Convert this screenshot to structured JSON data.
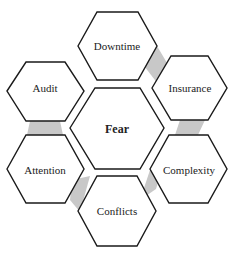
{
  "diagram": {
    "center": {
      "label": "Fear"
    },
    "nodes": [
      {
        "id": "downtime",
        "label": "Downtime"
      },
      {
        "id": "insurance",
        "label": "Insurance"
      },
      {
        "id": "complexity",
        "label": "Complexity"
      },
      {
        "id": "conflicts",
        "label": "Conflicts"
      },
      {
        "id": "attention",
        "label": "Attention"
      },
      {
        "id": "audit",
        "label": "Audit"
      }
    ],
    "colors": {
      "stroke": "#1a1a1a",
      "connector": "#c8c8c8",
      "background": "#ffffff"
    }
  }
}
